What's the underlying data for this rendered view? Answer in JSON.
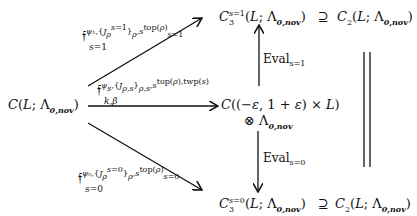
{
  "nodes": {
    "source": {
      "text": "C(L; Λ0,nov)"
    },
    "middle_line1": {
      "text": "C((−ε, 1 + ε) × L)"
    },
    "middle_line2": {
      "text": "⊗ Λ0,nov"
    },
    "top_left": {
      "text": "C3^{s=1}(L; Λ0,nov)"
    },
    "top_supseteq": {
      "text": "⊇"
    },
    "top_right": {
      "text": "C2(L; Λ0,nov)"
    },
    "bottom_left": {
      "text": "C3^{s=0}(L; Λ0,nov)"
    },
    "bottom_supseteq": {
      "text": "⊇"
    },
    "bottom_right": {
      "text": "C2(L; Λ0,nov)"
    }
  },
  "arrows": {
    "upper_diag": {
      "label": "f_{s=1}^{ψ1,{J_ρ^{s=1}}_ρ,s_{s=1}^{top(ρ)}}"
    },
    "horizontal": {
      "label": "f_{k,β}^{ψs,{J_{ρ,s}}_{ρ,s},s^{top(ρ),twp(s)}}"
    },
    "lower_diag": {
      "label": "f_{s=0}^{ψ0,{J_ρ^{s=0}}_ρ,s_{s=0}^{top(ρ)}}"
    },
    "eval_up": {
      "label": "Eval",
      "sub": "s=1"
    },
    "eval_down": {
      "label": "Eval",
      "sub": "s=0"
    },
    "equality": {
      "label": "="
    }
  }
}
